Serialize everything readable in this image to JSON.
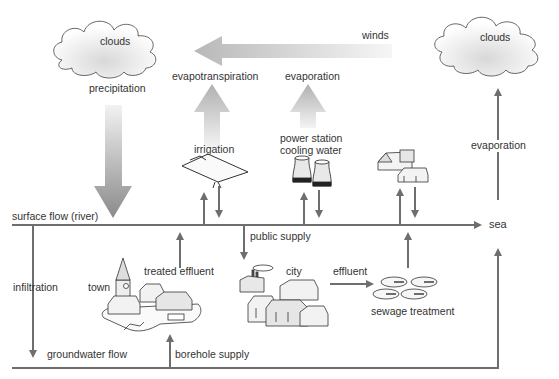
{
  "diagram": {
    "type": "water-cycle-flow",
    "colors": {
      "line": "#6e6e6e",
      "big_arrow_light": "#e6e6e6",
      "big_arrow_dark": "#8a8a8a",
      "text": "#333333"
    },
    "labels": {
      "clouds_left": "clouds",
      "clouds_right": "clouds",
      "winds": "winds",
      "precipitation": "precipitation",
      "evapotranspiration": "evapotranspiration",
      "evaporation_mid": "evaporation",
      "evaporation_right": "evaporation",
      "irrigation": "irrigation",
      "power_station_line1": "power station",
      "power_station_line2": "cooling water",
      "surface_flow": "surface flow (river)",
      "sea": "sea",
      "public_supply": "public supply",
      "infiltration": "infiltration",
      "town": "town",
      "treated_effluent": "treated effluent",
      "city": "city",
      "effluent": "effluent",
      "sewage_treatment": "sewage treatment",
      "groundwater_flow": "groundwater flow",
      "borehole_supply": "borehole supply"
    },
    "nodes": [
      {
        "id": "clouds_left",
        "icon": "cloud-icon"
      },
      {
        "id": "clouds_right",
        "icon": "cloud-icon"
      },
      {
        "id": "irrigation",
        "icon": "irrigated-field-icon"
      },
      {
        "id": "power_station",
        "icon": "cooling-tower-icon"
      },
      {
        "id": "houses",
        "icon": "houses-icon"
      },
      {
        "id": "town",
        "icon": "town-icon"
      },
      {
        "id": "city",
        "icon": "city-icon"
      },
      {
        "id": "sewage_treatment",
        "icon": "sewage-tanks-icon"
      }
    ]
  }
}
